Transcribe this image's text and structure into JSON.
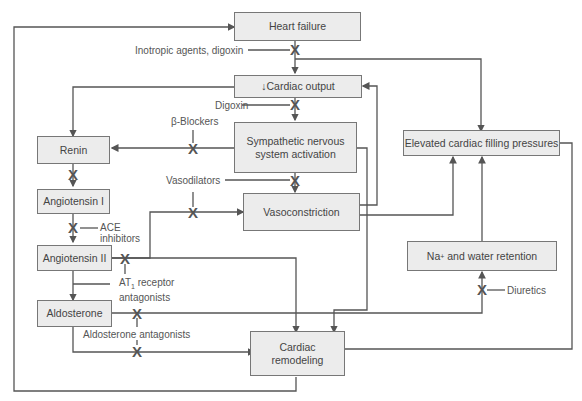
{
  "nodes": {
    "heart_failure": "Heart failure",
    "cardiac_output_arrow": "↓",
    "cardiac_output": "Cardiac output",
    "sympathetic_line1": "Sympathetic nervous",
    "sympathetic_line2": "system activation",
    "renin": "Renin",
    "angiotensin_i": "Angiotensin I",
    "angiotensin_ii": "Angiotensin II",
    "aldosterone": "Aldosterone",
    "vasoconstriction": "Vasoconstriction",
    "elevated_filling": "Elevated cardiac filling pressures",
    "na_retention_prefix": "Na",
    "na_retention_sup": "+",
    "na_retention_suffix": " and water retention",
    "remodeling_line1": "Cardiac",
    "remodeling_line2": "remodeling"
  },
  "drugs": {
    "inotropic": "Inotropic agents, digoxin",
    "digoxin": "Digoxin",
    "beta_blockers": "β-Blockers",
    "vasodilators": "Vasodilators",
    "ace_line1": "ACE",
    "ace_line2": "inhibitors",
    "at1_prefix": "AT",
    "at1_sub": "1",
    "at1_suffix": " receptor",
    "at1_line2": "antagonists",
    "aldosterone_antagonists": "Aldosterone antagonists",
    "diuretics": "Diuretics"
  },
  "symbols": {
    "block": "X"
  },
  "colors": {
    "box_fill": "#ececec",
    "line": "#555555",
    "text": "#444444"
  }
}
